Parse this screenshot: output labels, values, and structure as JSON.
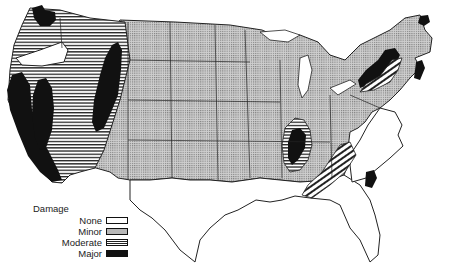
{
  "figure": {
    "type": "choropleth map"
  },
  "legend": {
    "title": "Damage",
    "items": [
      {
        "label": "None",
        "pattern": "white",
        "color": "#ffffff"
      },
      {
        "label": "Minor",
        "pattern": "dotted-gray",
        "color": "#b8b8b8"
      },
      {
        "label": "Moderate",
        "pattern": "horizontal-stripes",
        "color": "#e8e8e8"
      },
      {
        "label": "Major",
        "pattern": "solid-black",
        "color": "#111111"
      }
    ]
  },
  "regions": {
    "none": [
      "Southeast coast (Virginia, North Carolina)",
      "Gulf states (Louisiana, Mississippi, Alabama, Florida)",
      "Texas",
      "Central Oregon pocket"
    ],
    "minor": [
      "Great Plains",
      "Midwest",
      "Rocky Mountain east",
      "Northeast interior"
    ],
    "moderate": [
      "Pacific Northwest",
      "Nevada",
      "Utah/Idaho band",
      "New Madrid band",
      "Appalachian band",
      "New York band"
    ],
    "major": [
      "Western Washington",
      "Coastal California",
      "Central California",
      "Utah",
      "New Madrid region",
      "Upstate New York",
      "Coastal New England",
      "South Carolina coast",
      "Northern Maine"
    ]
  }
}
